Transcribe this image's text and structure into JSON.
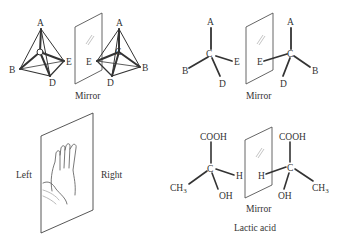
{
  "panels": {
    "tetrahedra": {
      "left": {
        "A": "A",
        "B": "B",
        "C": "C",
        "D": "D",
        "E": "E"
      },
      "right": {
        "A": "A",
        "B": "B",
        "C": "C",
        "D": "D",
        "E": "E"
      },
      "mirror_label": "Mirror"
    },
    "stick": {
      "left": {
        "A": "A",
        "B": "B",
        "C": "C",
        "D": "D",
        "E": "E"
      },
      "right": {
        "A": "A",
        "B": "B",
        "C": "C",
        "D": "D",
        "E": "E"
      },
      "mirror_label": "Mirror"
    },
    "hands": {
      "left_label": "Left",
      "right_label": "Right"
    },
    "lactic": {
      "left": {
        "top": "COOH",
        "center": "C",
        "left": "CH",
        "left_sub": "3",
        "bottom": "OH",
        "right": "H"
      },
      "right": {
        "top": "COOH",
        "center": "C",
        "right": "CH",
        "right_sub": "3",
        "bottom": "OH",
        "left": "H"
      },
      "mirror_label": "Mirror",
      "caption": "Lactic acid"
    }
  },
  "colors": {
    "ink": "#333333",
    "mirror": "#555555",
    "faint": "#aaaaaa"
  }
}
